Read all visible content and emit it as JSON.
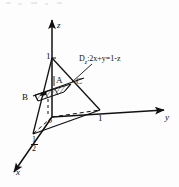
{
  "figure": {
    "background_color": "#fdfdfd",
    "stroke_color": "#111111"
  },
  "axes": [
    {
      "name": "z",
      "label": "z",
      "direction": "up"
    },
    {
      "name": "y",
      "label": "y",
      "direction": "right"
    },
    {
      "name": "x",
      "label": "x",
      "direction": "down-left"
    }
  ],
  "origin": {
    "label": "o"
  },
  "ticks": [
    {
      "axis": "z",
      "label": "1"
    },
    {
      "axis": "y",
      "label": "1"
    },
    {
      "axis": "x",
      "label_numerator": "1",
      "label_denominator": "2"
    }
  ],
  "points": [
    {
      "name": "A",
      "label": "A"
    },
    {
      "name": "B",
      "label": "B"
    },
    {
      "name": "C",
      "label": "C"
    }
  ],
  "annotations": [
    {
      "name": "region-equation",
      "prefix": "D",
      "subscript": "z",
      "body": ":2x+y=1-z"
    }
  ]
}
